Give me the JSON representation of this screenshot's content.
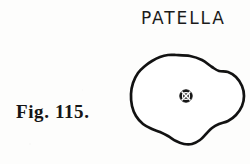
{
  "plate": {
    "title": "PATELLA",
    "caption": "Fig. 115.",
    "background_color": "#fdfdfc",
    "ink_color": "#121212"
  },
  "drawing": {
    "subject": "patella-outline",
    "description": "irregular rounded outline of the patella (kneecap) seen in outline view",
    "center_marker": {
      "name": "circled-cross-marker",
      "symbol": "crossed-circle",
      "fill_color": "#141414",
      "mark_color": "#ffffff",
      "center_x": 62,
      "center_y": 52,
      "radius": 6.2
    },
    "outline_points": [
      [
        52,
        11
      ],
      [
        66,
        12
      ],
      [
        78,
        16
      ],
      [
        88,
        23
      ],
      [
        95,
        27
      ],
      [
        104,
        28
      ],
      [
        112,
        33
      ],
      [
        118,
        42
      ],
      [
        120,
        52
      ],
      [
        118,
        62
      ],
      [
        112,
        71
      ],
      [
        104,
        77
      ],
      [
        95,
        80
      ],
      [
        88,
        84
      ],
      [
        82,
        90
      ],
      [
        76,
        96
      ],
      [
        68,
        100
      ],
      [
        60,
        100
      ],
      [
        52,
        97
      ],
      [
        44,
        92
      ],
      [
        36,
        88
      ],
      [
        28,
        85
      ],
      [
        19,
        80
      ],
      [
        12,
        72
      ],
      [
        8,
        62
      ],
      [
        7,
        50
      ],
      [
        9,
        39
      ],
      [
        14,
        29
      ],
      [
        21,
        22
      ],
      [
        28,
        17
      ],
      [
        36,
        13
      ],
      [
        44,
        11
      ]
    ]
  },
  "icons": {
    "crossed-circle": "⊗"
  }
}
